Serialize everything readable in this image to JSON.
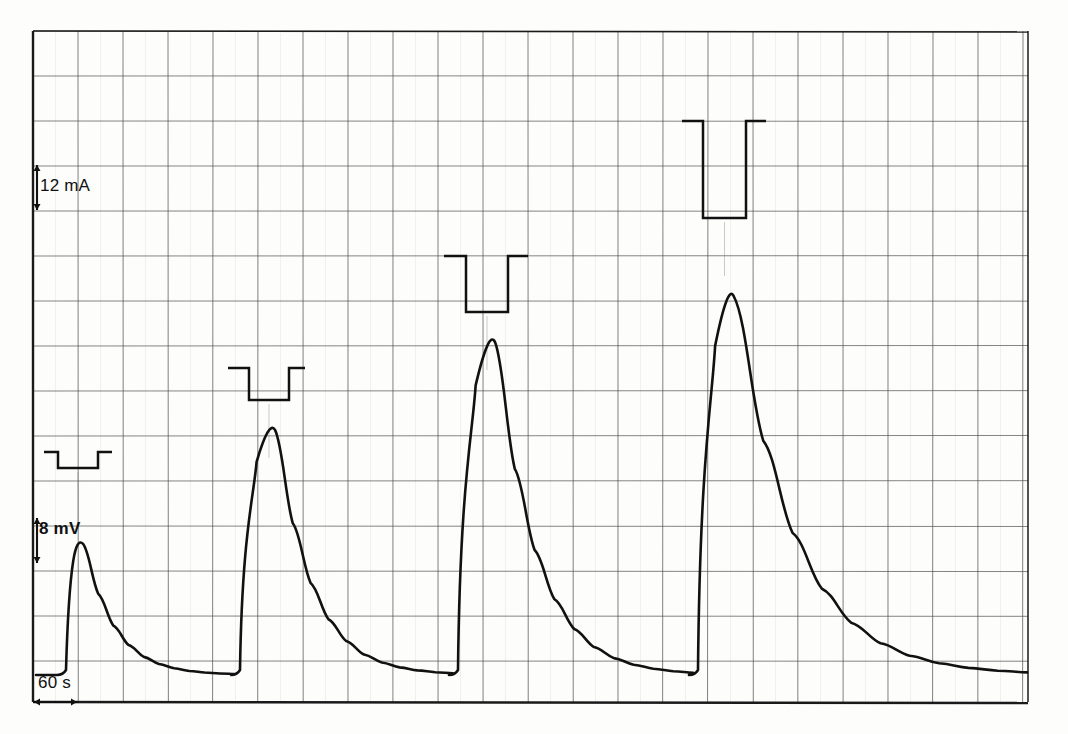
{
  "figure": {
    "kind": "chart-recorder-trace",
    "background": "#fdfdfc",
    "ink": "#111111",
    "grid_major_color": "#4a4a4a",
    "grid_minor_color": "#9a9a9a",
    "frame_color": "#1a1a1a"
  },
  "scale_bars": {
    "current": {
      "label": "12 mA",
      "orientation": "vertical",
      "x": 33,
      "y_top": 165,
      "y_bottom": 210
    },
    "voltage": {
      "label": "8 mV",
      "orientation": "vertical",
      "x": 33,
      "y_top": 518,
      "y_bottom": 563
    },
    "time": {
      "label": "60 s",
      "orientation": "horizontal",
      "y": 702,
      "x_left": 33,
      "x_right": 78
    }
  },
  "chart_data": {
    "type": "line",
    "title": "",
    "subtitle": "",
    "xlabel": "",
    "ylabel": "",
    "grid": true,
    "legend": null,
    "annotations": [
      "12 mA",
      "8 mV",
      "60 s"
    ],
    "axis_calibration": {
      "x_seconds_per_division": 60,
      "y_millivolts_per_division": 8,
      "stimulus_milliamps_per_division": 12,
      "division_px_x": 45,
      "division_px_y": 45
    },
    "plot_box_px": {
      "left": 33,
      "top": 31,
      "right": 1028,
      "bottom": 702
    },
    "baseline_px_y": 676,
    "series": [
      {
        "name": "response",
        "description": "Evoked voltage response, four successive stimuli of increasing intensity",
        "peaks": [
          {
            "index": 1,
            "onset_px_x": 66,
            "apex_px_x": 78,
            "apex_px_y": 539,
            "amplitude_mv": 24.4,
            "peak_time_s": 60
          },
          {
            "index": 2,
            "onset_px_x": 240,
            "apex_px_x": 270,
            "apex_px_y": 421,
            "amplitude_mv": 45.3,
            "peak_time_s": 316
          },
          {
            "index": 3,
            "onset_px_x": 458,
            "apex_px_x": 490,
            "apex_px_y": 330,
            "amplitude_mv": 61.5,
            "peak_time_s": 609
          },
          {
            "index": 4,
            "onset_px_x": 698,
            "apex_px_x": 729,
            "apex_px_y": 283,
            "amplitude_mv": 69.9,
            "peak_time_s": 928
          }
        ]
      },
      {
        "name": "stimulus",
        "description": "Square current pulses drawn above the trace, one per response",
        "pulses": [
          {
            "index": 1,
            "shoulder_px_y": 452,
            "floor_px_y": 468,
            "left_px_x": 58,
            "right_px_x": 98,
            "lead_px_x": 44,
            "tail_px_x": 112,
            "amplitude_ma": 4.3
          },
          {
            "index": 2,
            "shoulder_px_y": 368,
            "floor_px_y": 400,
            "left_px_x": 249,
            "right_px_x": 289,
            "lead_px_x": 228,
            "tail_px_x": 305,
            "amplitude_ma": 8.5
          },
          {
            "index": 3,
            "shoulder_px_y": 256,
            "floor_px_y": 312,
            "left_px_x": 466,
            "right_px_x": 508,
            "lead_px_x": 444,
            "tail_px_x": 528,
            "amplitude_ma": 14.9
          },
          {
            "index": 4,
            "shoulder_px_y": 121,
            "floor_px_y": 218,
            "left_px_x": 703,
            "right_px_x": 746,
            "lead_px_x": 682,
            "tail_px_x": 766,
            "amplitude_ma": 25.9
          }
        ]
      }
    ]
  }
}
